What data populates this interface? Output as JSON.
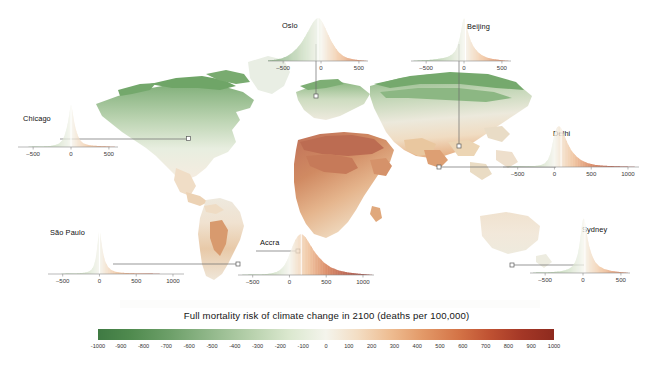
{
  "figure": {
    "type": "choropleth-map-with-inset-distributions",
    "width": 653,
    "height": 371
  },
  "legend": {
    "title": "Full mortality risk of climate change in 2100 (deaths per 100,000)",
    "colorbar": {
      "min": -1000,
      "max": 1000,
      "ticks": [
        -1000,
        -900,
        -800,
        -700,
        -600,
        -500,
        -400,
        -300,
        -200,
        -100,
        0,
        100,
        200,
        300,
        400,
        500,
        600,
        700,
        800,
        900,
        1000
      ],
      "tick_labels": [
        "-1000",
        "-900",
        "-800",
        "-700",
        "-600",
        "-500",
        "-400",
        "-300",
        "-200",
        "-100",
        "0",
        "100",
        "200",
        "300",
        "400",
        "500",
        "600",
        "700",
        "800",
        "900",
        "1000"
      ],
      "low_color": "#3f7a43",
      "mid_color": "#f4f4ec",
      "high_color": "#8e2a1e",
      "orientation": "horizontal"
    }
  },
  "chart_data": {
    "type": "area",
    "title": "Full mortality risk of climate change in 2100 (deaths per 100,000)",
    "xlabel": "deaths per 100,000",
    "ylabel": "",
    "grid": false,
    "legend_position": "bottom",
    "colormap": {
      "min": -1000,
      "max": 1000,
      "low_color": "#3f7a43",
      "mid_color": "#f4f4ec",
      "high_color": "#8e2a1e"
    },
    "series": [
      {
        "name": "Chicago",
        "city": "Chicago",
        "median": 0,
        "xlim": [
          -700,
          620
        ],
        "ticks": [
          -500,
          0,
          500
        ],
        "tick_labels": [
          "-500",
          "0",
          "500"
        ],
        "shape": "narrow-spike",
        "x": [
          -700,
          -600,
          -500,
          -400,
          -300,
          -250,
          -200,
          -160,
          -120,
          -90,
          -60,
          -40,
          -25,
          -10,
          0,
          10,
          25,
          40,
          60,
          90,
          120,
          160,
          200,
          250,
          300,
          400,
          500,
          620
        ],
        "y": [
          0.0,
          0.0,
          0.01,
          0.01,
          0.02,
          0.03,
          0.05,
          0.08,
          0.14,
          0.24,
          0.42,
          0.58,
          0.74,
          0.92,
          1.0,
          0.93,
          0.76,
          0.6,
          0.43,
          0.26,
          0.16,
          0.09,
          0.06,
          0.04,
          0.03,
          0.02,
          0.01,
          0.0
        ]
      },
      {
        "name": "Oslo",
        "city": "Oslo",
        "median": -40,
        "xlim": [
          -700,
          620
        ],
        "ticks": [
          -500,
          0,
          500
        ],
        "tick_labels": [
          "-500",
          "0",
          "500"
        ],
        "shape": "broad-bell",
        "x": [
          -700,
          -600,
          -520,
          -450,
          -380,
          -320,
          -260,
          -210,
          -170,
          -130,
          -100,
          -70,
          -45,
          -20,
          0,
          25,
          55,
          90,
          130,
          180,
          230,
          290,
          350,
          420,
          500,
          560,
          620
        ],
        "y": [
          0.01,
          0.03,
          0.06,
          0.11,
          0.19,
          0.29,
          0.42,
          0.56,
          0.69,
          0.82,
          0.91,
          0.97,
          1.0,
          0.99,
          0.95,
          0.88,
          0.77,
          0.63,
          0.48,
          0.33,
          0.21,
          0.12,
          0.07,
          0.04,
          0.02,
          0.01,
          0.0
        ]
      },
      {
        "name": "Beijing",
        "city": "Beijing",
        "median": 20,
        "xlim": [
          -700,
          620
        ],
        "ticks": [
          -500,
          0,
          500
        ],
        "tick_labels": [
          "-500",
          "0",
          "500"
        ],
        "shape": "sharp-peak-right-tail",
        "x": [
          -700,
          -600,
          -500,
          -420,
          -340,
          -270,
          -210,
          -160,
          -120,
          -90,
          -60,
          -35,
          -15,
          0,
          15,
          35,
          60,
          90,
          130,
          180,
          240,
          300,
          370,
          450,
          530,
          620
        ],
        "y": [
          0.0,
          0.01,
          0.02,
          0.03,
          0.05,
          0.07,
          0.1,
          0.15,
          0.22,
          0.33,
          0.51,
          0.74,
          0.93,
          1.0,
          0.95,
          0.8,
          0.62,
          0.46,
          0.32,
          0.21,
          0.13,
          0.08,
          0.05,
          0.03,
          0.01,
          0.0
        ]
      },
      {
        "name": "Delhi",
        "city": "Delhi",
        "median": 90,
        "xlim": [
          -700,
          1150
        ],
        "ticks": [
          -500,
          0,
          500,
          1000
        ],
        "tick_labels": [
          "-500",
          "0",
          "500",
          "1000"
        ],
        "shape": "peak-right-of-zero",
        "x": [
          -700,
          -550,
          -420,
          -320,
          -240,
          -180,
          -130,
          -90,
          -55,
          -25,
          0,
          25,
          55,
          85,
          110,
          145,
          185,
          235,
          295,
          370,
          460,
          560,
          680,
          820,
          980,
          1150
        ],
        "y": [
          0.0,
          0.01,
          0.01,
          0.02,
          0.03,
          0.05,
          0.09,
          0.17,
          0.33,
          0.58,
          0.8,
          0.94,
          1.0,
          0.97,
          0.88,
          0.72,
          0.55,
          0.39,
          0.26,
          0.16,
          0.09,
          0.05,
          0.03,
          0.02,
          0.01,
          0.0
        ]
      },
      {
        "name": "São Paulo",
        "city": "São Paulo",
        "median": 0,
        "xlim": [
          -700,
          1150
        ],
        "ticks": [
          -500,
          0,
          500,
          1000
        ],
        "tick_labels": [
          "-500",
          "0",
          "500",
          "1000"
        ],
        "shape": "narrow-spike",
        "x": [
          -700,
          -560,
          -440,
          -340,
          -260,
          -200,
          -150,
          -110,
          -80,
          -55,
          -35,
          -18,
          -6,
          0,
          6,
          18,
          35,
          55,
          80,
          115,
          160,
          215,
          290,
          390,
          520,
          690,
          900,
          1150
        ],
        "y": [
          0.0,
          0.0,
          0.01,
          0.01,
          0.02,
          0.03,
          0.05,
          0.09,
          0.17,
          0.31,
          0.53,
          0.78,
          0.95,
          1.0,
          0.96,
          0.81,
          0.61,
          0.42,
          0.27,
          0.16,
          0.09,
          0.05,
          0.03,
          0.02,
          0.01,
          0.01,
          0.0,
          0.0
        ]
      },
      {
        "name": "Accra",
        "city": "Accra",
        "median": 160,
        "xlim": [
          -700,
          1150
        ],
        "ticks": [
          -500,
          0,
          500,
          1000
        ],
        "tick_labels": [
          "-500",
          "0",
          "500",
          "1000"
        ],
        "shape": "broad-peak-right",
        "x": [
          -700,
          -550,
          -430,
          -330,
          -250,
          -180,
          -120,
          -70,
          -25,
          10,
          45,
          80,
          115,
          150,
          185,
          225,
          270,
          325,
          390,
          470,
          560,
          670,
          800,
          950,
          1150
        ],
        "y": [
          0.0,
          0.01,
          0.01,
          0.02,
          0.04,
          0.07,
          0.13,
          0.23,
          0.38,
          0.55,
          0.71,
          0.85,
          0.95,
          1.0,
          0.98,
          0.9,
          0.77,
          0.61,
          0.45,
          0.3,
          0.19,
          0.11,
          0.06,
          0.03,
          0.0
        ]
      },
      {
        "name": "Sydney",
        "city": "Sydney",
        "median": 25,
        "xlim": [
          -700,
          620
        ],
        "ticks": [
          -500,
          0,
          500
        ],
        "tick_labels": [
          "-500",
          "0",
          "500"
        ],
        "shape": "narrow-spike",
        "x": [
          -700,
          -580,
          -470,
          -380,
          -300,
          -235,
          -180,
          -135,
          -100,
          -70,
          -45,
          -25,
          -10,
          5,
          20,
          35,
          55,
          80,
          115,
          160,
          215,
          285,
          370,
          470,
          620
        ],
        "y": [
          0.0,
          0.01,
          0.01,
          0.02,
          0.03,
          0.05,
          0.08,
          0.13,
          0.21,
          0.34,
          0.53,
          0.75,
          0.92,
          1.0,
          0.97,
          0.85,
          0.67,
          0.49,
          0.33,
          0.2,
          0.12,
          0.07,
          0.04,
          0.02,
          0.0
        ]
      }
    ]
  },
  "insets": [
    {
      "id": "chicago",
      "label": "Chicago",
      "series_index": 0
    },
    {
      "id": "oslo",
      "label": "Oslo",
      "series_index": 1
    },
    {
      "id": "beijing",
      "label": "Beijing",
      "series_index": 2
    },
    {
      "id": "delhi",
      "label": "Delhi",
      "series_index": 3
    },
    {
      "id": "saopaulo",
      "label": "São Paulo",
      "series_index": 4
    },
    {
      "id": "accra",
      "label": "Accra",
      "series_index": 5
    },
    {
      "id": "sydney",
      "label": "Sydney",
      "series_index": 6
    }
  ]
}
